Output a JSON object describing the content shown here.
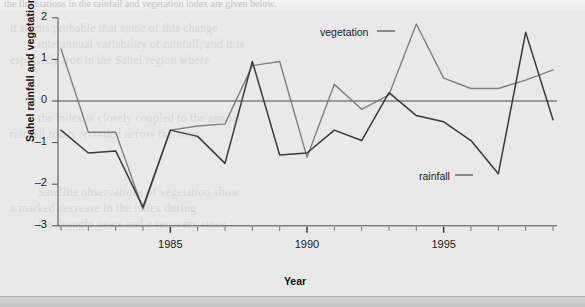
{
  "figure": {
    "background_color": "#e9e9e9",
    "ghost_text_top": "the fluctuations in the rainfall and vegetation index are given below.",
    "ghost_lines": [
      "it seems probable that some of this change",
      "interannual variability of rainfall, and it is",
      "especially true in the Sahel region where",
      "the index is closely coupled to the annual",
      "rainfall totals recorded across the zone.",
      "Satellite observations of vegetation show",
      "a marked decrease in the index during",
      "the drought years and a recovery since."
    ]
  },
  "axes": {
    "ylabel": "Sahel rainfall and vegetation index",
    "xlabel": "Year",
    "ytick_labels": [
      "2",
      "1",
      "0",
      "–1",
      "–2",
      "–3"
    ],
    "xtick_labels": [
      "1985",
      "1990",
      "1995"
    ]
  },
  "annotations": {
    "vegetation": "vegetation",
    "rainfall": "rainfall"
  },
  "colors": {
    "vegetation": "#808080",
    "rainfall": "#3a3a3a",
    "axis": "#4a4a4a",
    "background": "#e9e9e9"
  },
  "chart_data": {
    "type": "line",
    "title": "",
    "xlabel": "Year",
    "ylabel": "Sahel rainfall and vegetation index",
    "xlim": [
      1981,
      1999
    ],
    "ylim": [
      -3,
      2
    ],
    "yticks": [
      -3,
      -2,
      -1,
      0,
      1,
      2
    ],
    "xticks": [
      1981,
      1982,
      1983,
      1984,
      1985,
      1986,
      1987,
      1988,
      1989,
      1990,
      1991,
      1992,
      1993,
      1994,
      1995,
      1996,
      1997,
      1998,
      1999
    ],
    "xtick_labeled": [
      1985,
      1990,
      1995
    ],
    "grid": false,
    "legend": "inline annotations",
    "zero_line": 0,
    "x": [
      1981,
      1982,
      1983,
      1984,
      1985,
      1986,
      1987,
      1988,
      1989,
      1990,
      1991,
      1992,
      1993,
      1994,
      1995,
      1996,
      1997,
      1998,
      1999
    ],
    "series": [
      {
        "name": "vegetation",
        "color": "#808080",
        "values": [
          1.25,
          -0.75,
          -0.75,
          -2.6,
          -0.7,
          -0.6,
          -0.55,
          0.85,
          0.95,
          -1.35,
          0.4,
          -0.2,
          0.15,
          1.85,
          0.55,
          0.3,
          0.3,
          0.5,
          0.75
        ]
      },
      {
        "name": "rainfall",
        "color": "#3a3a3a",
        "values": [
          -0.7,
          -1.25,
          -1.2,
          -2.55,
          -0.7,
          -0.85,
          -1.5,
          0.95,
          -1.3,
          -1.25,
          -0.7,
          -0.95,
          0.2,
          -0.35,
          -0.5,
          -0.95,
          -1.75,
          1.65,
          -0.45
        ]
      }
    ]
  }
}
